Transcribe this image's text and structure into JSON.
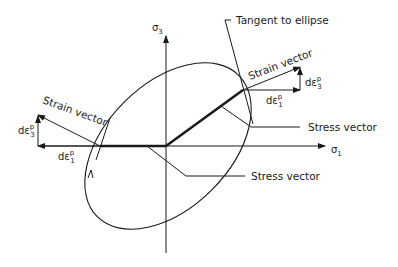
{
  "figure": {
    "type": "diagram",
    "line_color": "#1a1a1a",
    "background": "#ffffff"
  },
  "axes": {
    "horizontal": {
      "symbol": "σ",
      "subscript": "1"
    },
    "vertical": {
      "symbol": "σ",
      "subscript": "3"
    }
  },
  "labels": {
    "tangent": "Tangent to ellipse",
    "strain_right": "Strain vector",
    "strain_left": "Strain vector",
    "stress_right": "Stress vector",
    "stress_bottom": "Stress vector"
  },
  "components": {
    "right_de1": {
      "prefix": "dε",
      "sup": "p",
      "sub": "1"
    },
    "right_de3": {
      "prefix": "dε",
      "sup": "p",
      "sub": "3"
    },
    "left_de1": {
      "prefix": "dε",
      "sup": "p",
      "sub": "1"
    },
    "left_de3": {
      "prefix": "dε",
      "sup": "p",
      "sub": "3"
    }
  }
}
